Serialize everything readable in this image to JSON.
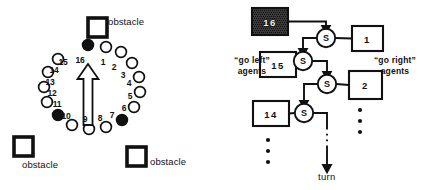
{
  "figure": {
    "background_color": "#ffffff",
    "stroke_color": "#111111"
  },
  "left_panel": {
    "name": "sensor-ring-diagram",
    "heading_arrow": {
      "label": "heading-arrow",
      "direction": "up",
      "filled": false
    },
    "obstacles": [
      {
        "id": "obstacle-top",
        "label": "obstacle",
        "x": 88,
        "y": 18,
        "label_x": 108,
        "label_y": 17
      },
      {
        "id": "obstacle-bottom-left",
        "label": "obstacle",
        "x": 14,
        "y": 137,
        "label_x": 22,
        "label_y": 160
      },
      {
        "id": "obstacle-bottom-right",
        "label": "obstacle",
        "x": 127,
        "y": 147,
        "label_x": 150,
        "label_y": 157
      }
    ],
    "sensors": [
      {
        "n": "1",
        "filled": false,
        "cx": 106,
        "cy": 47,
        "tx": 103,
        "ty": 62
      },
      {
        "n": "2",
        "filled": false,
        "cx": 121,
        "cy": 52,
        "tx": 114,
        "ty": 67
      },
      {
        "n": "3",
        "filled": false,
        "cx": 132,
        "cy": 63,
        "tx": 123,
        "ty": 75
      },
      {
        "n": "4",
        "filled": false,
        "cx": 139,
        "cy": 77,
        "tx": 129,
        "ty": 83
      },
      {
        "n": "5",
        "filled": false,
        "cx": 140,
        "cy": 92,
        "tx": 130,
        "ty": 96
      },
      {
        "n": "6",
        "filled": false,
        "cx": 134,
        "cy": 107,
        "tx": 124,
        "ty": 108
      },
      {
        "n": "7",
        "filled": true,
        "cx": 122,
        "cy": 120,
        "tx": 112,
        "ty": 115
      },
      {
        "n": "8",
        "filled": false,
        "cx": 106,
        "cy": 127,
        "tx": 100,
        "ty": 118
      },
      {
        "n": "9",
        "filled": false,
        "cx": 89,
        "cy": 129,
        "tx": 85,
        "ty": 119
      },
      {
        "n": "10",
        "filled": false,
        "cx": 72,
        "cy": 125,
        "tx": 66,
        "ty": 116
      },
      {
        "n": "11",
        "filled": true,
        "cx": 58,
        "cy": 115,
        "tx": 57,
        "ty": 104
      },
      {
        "n": "12",
        "filled": false,
        "cx": 47,
        "cy": 102,
        "tx": 52,
        "ty": 93
      },
      {
        "n": "13",
        "filled": false,
        "cx": 44,
        "cy": 87,
        "tx": 50,
        "ty": 82
      },
      {
        "n": "14",
        "filled": false,
        "cx": 48,
        "cy": 72,
        "tx": 54,
        "ty": 70
      },
      {
        "n": "15",
        "filled": false,
        "cx": 58,
        "cy": 59,
        "tx": 63,
        "ty": 62
      },
      {
        "n": "16",
        "filled": true,
        "cx": 88,
        "cy": 45,
        "tx": 80,
        "ty": 60
      }
    ]
  },
  "right_panel": {
    "name": "arbitration-network-diagram",
    "left_agents_caption": "“go left”\nagents",
    "right_agents_caption": "“go right”\nagents",
    "output_label": "turn",
    "selector_label": "S",
    "left_boxes": [
      {
        "id": "box-16",
        "label": "16",
        "filled": true,
        "x": 32,
        "y": 8,
        "w": 36,
        "h": 27
      },
      {
        "id": "box-15",
        "label": "15",
        "filled": false,
        "x": 40,
        "y": 52,
        "w": 36,
        "h": 25
      },
      {
        "id": "box-14",
        "label": "14",
        "filled": false,
        "x": 33,
        "y": 101,
        "w": 36,
        "h": 25
      }
    ],
    "right_boxes": [
      {
        "id": "box-1",
        "label": "1",
        "filled": false,
        "x": 132,
        "y": 26,
        "w": 31,
        "h": 25
      },
      {
        "id": "box-2",
        "label": "2",
        "filled": false,
        "x": 129,
        "y": 71,
        "w": 33,
        "h": 28
      }
    ],
    "selectors": [
      {
        "id": "selector-1",
        "cx": 106,
        "cy": 38
      },
      {
        "id": "selector-2",
        "cx": 83,
        "cy": 61
      },
      {
        "id": "selector-3",
        "cx": 107,
        "cy": 84
      },
      {
        "id": "selector-4",
        "cx": 84,
        "cy": 113
      }
    ],
    "ellipsis_left": {
      "x": 48,
      "y": 140,
      "count": 3
    },
    "ellipsis_right": {
      "x": 140,
      "y": 110,
      "count": 3
    },
    "captions": {
      "left_caption_x": 2,
      "left_caption_y": 55,
      "right_caption_x": 140,
      "right_caption_y": 55,
      "turn_x": 98,
      "turn_y": 172
    }
  }
}
